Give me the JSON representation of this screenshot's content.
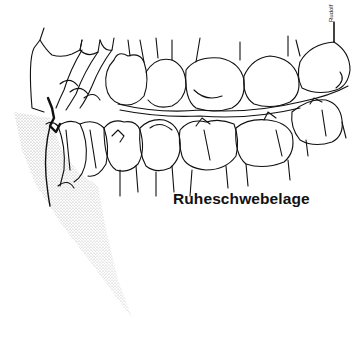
{
  "figure": {
    "label": "Ruheschwebelage",
    "signature": "Rudolf",
    "colors": {
      "line": "#111111",
      "stipple": "#9a9a9a",
      "background": "#ffffff"
    }
  }
}
